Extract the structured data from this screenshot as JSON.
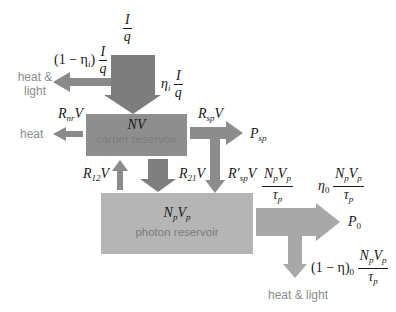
{
  "diagram": {
    "colors": {
      "arrow_dark": "#7d7d7d",
      "arrow_mid": "#8f8f8f",
      "arrow_light": "#a8a8a8",
      "carrier_box": "#8e8e8e",
      "photon_box": "#b5b5b5",
      "text_gray": "#8c8c8c"
    },
    "input": {
      "numerator": "I",
      "denominator": "q"
    },
    "injection_loss": {
      "prefix": "(1 − η",
      "sub": "i",
      "suffix": ")",
      "numerator": "I",
      "denominator": "q",
      "destination": "heat & light"
    },
    "injected": {
      "prefix": "η",
      "sub": "i",
      "numerator": "I",
      "denominator": "q"
    },
    "carrier_reservoir": {
      "symbol": "NV",
      "label": "carrier reservoir"
    },
    "nonradiative": {
      "R": "R",
      "sub": "nr",
      "V": "V",
      "destination": "heat"
    },
    "spontaneous": {
      "R": "R",
      "sub": "sp",
      "V": "V",
      "destination": "P",
      "destination_sub": "sp"
    },
    "spontaneous_coupled": {
      "R": "R′",
      "sub": "sp",
      "V": "V"
    },
    "absorption": {
      "R": "R",
      "sub": "12",
      "V": "V"
    },
    "stimulated": {
      "R": "R",
      "sub": "21",
      "V": "V"
    },
    "photon_reservoir": {
      "symbol_N": "N",
      "symbol_N_sub": "p",
      "symbol_V": "V",
      "symbol_V_sub": "p",
      "label": "photon reservoir"
    },
    "photon_loss": {
      "num_N": "N",
      "num_N_sub": "p",
      "num_V": "V",
      "num_V_sub": "p",
      "den": "τ",
      "den_sub": "p"
    },
    "output": {
      "prefix": "η",
      "prefix_sub": "0",
      "num_N": "N",
      "num_N_sub": "p",
      "num_V": "V",
      "num_V_sub": "p",
      "den": "τ",
      "den_sub": "p",
      "destination": "P",
      "destination_sub": "0"
    },
    "internal_loss": {
      "prefix": "(1 − η)",
      "prefix_sub": "0",
      "num_N": "N",
      "num_N_sub": "p",
      "num_V": "V",
      "num_V_sub": "p",
      "den": "τ",
      "den_sub": "p",
      "destination": "heat & light"
    }
  }
}
